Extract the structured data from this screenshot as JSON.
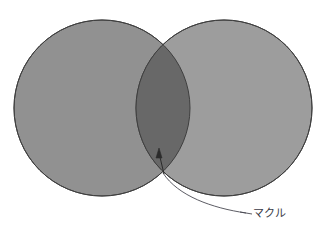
{
  "diagram": {
    "type": "venn-two-circle",
    "background_color": "#ffffff",
    "canvas": {
      "width": 326,
      "height": 235
    },
    "circles": [
      {
        "name": "left-circle",
        "cx": 102,
        "cy": 108,
        "r": 88,
        "fill": "#919191",
        "stroke": "#3f3f3f",
        "stroke_width": 1
      },
      {
        "name": "right-circle",
        "cx": 224,
        "cy": 108,
        "r": 88,
        "fill": "#9d9d9d",
        "stroke": "#3f3f3f",
        "stroke_width": 1
      }
    ],
    "intersection": {
      "name": "lens-region",
      "fill": "#686868",
      "top_point": {
        "x": 163,
        "y": 42
      },
      "bottom_point": {
        "x": 163,
        "y": 173
      }
    },
    "annotation": {
      "label": "マクル",
      "label_x": 248,
      "label_y": 217,
      "color": "#3a3a46",
      "arrow_tip": {
        "x": 159,
        "y": 150
      },
      "arrow_tail": {
        "x": 164,
        "y": 174
      },
      "leader_start": {
        "x": 163,
        "y": 173
      },
      "leader_end": {
        "x": 246,
        "y": 213
      },
      "leader_control": {
        "x": 196,
        "y": 210
      }
    }
  }
}
